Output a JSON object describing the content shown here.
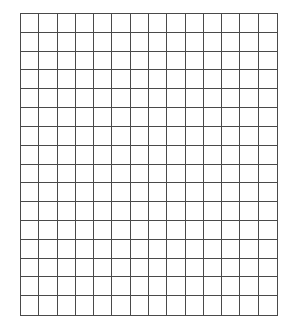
{
  "grid": {
    "columns": 14,
    "rows": 16,
    "line_color": "#4a4a4a",
    "background": "#ffffff"
  }
}
